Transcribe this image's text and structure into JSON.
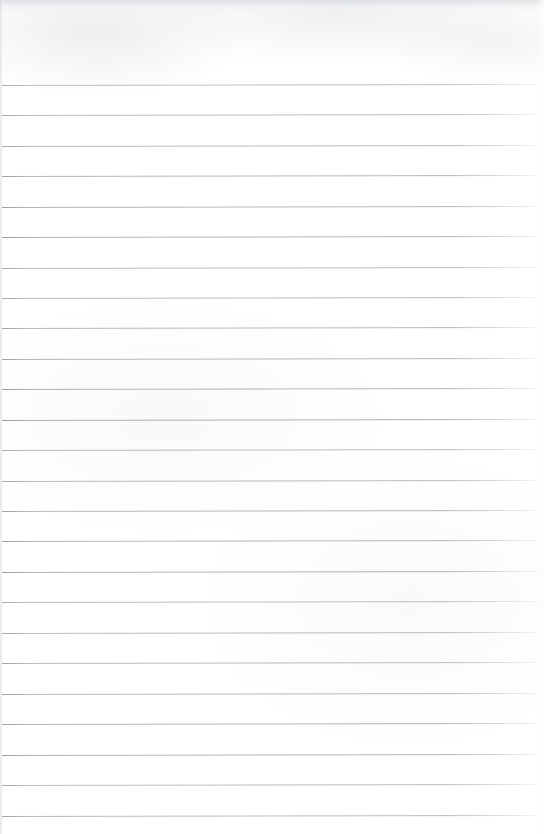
{
  "page": {
    "kind": "scanned-blank-ruled-notebook-page",
    "width": 544,
    "height": 834,
    "background_color": "#fdfdfd",
    "has_text": false,
    "text_content": "",
    "top_margin_px": 85,
    "has_left_margin_rule": false,
    "has_header": false,
    "has_footer": false,
    "page_number": "",
    "title": ""
  },
  "ruling": {
    "line_color": "#aab0b9",
    "line_thickness_px": 1,
    "line_spacing_px": 30.4,
    "first_line_y": 85,
    "line_count": 25,
    "line_start_x": 2,
    "line_end_x": 537,
    "slope_deg": -0.12,
    "positions_y": [
      85,
      115,
      146,
      176,
      207,
      237,
      268,
      298,
      328,
      359,
      389,
      420,
      450,
      481,
      511,
      541,
      572,
      602,
      633,
      663,
      694,
      724,
      755,
      785,
      816
    ]
  },
  "texture": {
    "top_band_color": "#d6d9dd",
    "top_band_height_px": 12,
    "left_edge_shadow_color": "#ced2d7",
    "left_edge_width_px": 4
  }
}
